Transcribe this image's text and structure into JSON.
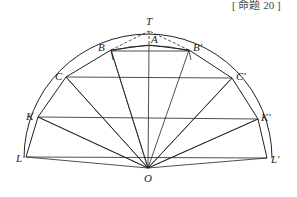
{
  "caption": "[ 命题 20 ]",
  "labels": {
    "T": "T",
    "A": "A",
    "B": "B",
    "B2": "B′",
    "C": "C",
    "C2": "C′",
    "K": "K",
    "K2": "K′",
    "L": "L",
    "L2": "L′",
    "O": "O"
  },
  "colors": {
    "stroke": "#222222",
    "background": "#ffffff"
  }
}
